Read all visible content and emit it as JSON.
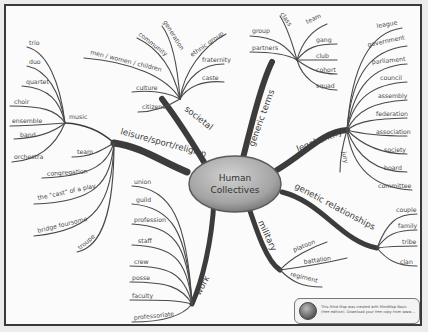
{
  "center": {
    "line1": "Human",
    "line2": "Collectives"
  },
  "branches": {
    "societal": {
      "label": "societal",
      "items": [
        "generation",
        "community",
        "ethnic group",
        "men / women / children",
        "fraternity",
        "caste",
        "culture",
        "citizens"
      ]
    },
    "generic_terms": {
      "label": "generic terms",
      "items": [
        "class",
        "team",
        "group",
        "gang",
        "partners",
        "club",
        "cohort",
        "squad"
      ]
    },
    "legal_entity": {
      "label": "legal entity",
      "items": [
        "league",
        "government",
        "parliament",
        "council",
        "assembly",
        "federation",
        "association",
        "society",
        "board",
        "committee",
        "jury"
      ]
    },
    "leisure": {
      "label": "leisure/sport/religion",
      "music": {
        "label": "music",
        "items": [
          "trio",
          "duo",
          "quartet",
          "choir",
          "ensemble",
          "band",
          "orchestra"
        ]
      },
      "items": [
        "team",
        "congregation",
        "the \"cast\" of a play",
        "bridge foursome",
        "troupe"
      ]
    },
    "genetic": {
      "label": "genetic relationships",
      "items": [
        "couple",
        "family",
        "tribe",
        "clan"
      ]
    },
    "military": {
      "label": "military",
      "items": [
        "platoon",
        "battalion",
        "regiment"
      ]
    },
    "work": {
      "label": "work",
      "items": [
        "union",
        "guild",
        "profession",
        "staff",
        "crew",
        "posse",
        "faculty",
        "professoriate"
      ]
    }
  },
  "footer": {
    "text": "This Mind Map was created with MindMap Basic (free edition). Download your free copy from www.…"
  },
  "colors": {
    "branch": "#3c3c3c",
    "center_fill": "#a9a9a9",
    "background": "#fbfbfb"
  }
}
